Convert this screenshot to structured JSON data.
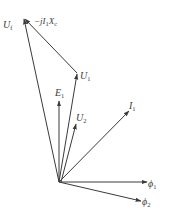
{
  "diagram": {
    "type": "phasor-diagram",
    "origin": {
      "x": 59,
      "y": 182
    },
    "stroke_color": "#3a3a3a",
    "background": "#ffffff",
    "vectors": [
      {
        "id": "Uf",
        "label": "U",
        "sub": "f",
        "from": [
          59,
          182
        ],
        "to": [
          24,
          18
        ],
        "label_pos": [
          3,
          27
        ]
      },
      {
        "id": "jIXc",
        "label": "−jI",
        "sub": "1",
        "label2": "X",
        "sub2": "c",
        "from": [
          77,
          73
        ],
        "to": [
          24,
          18
        ],
        "label_pos": [
          33,
          23
        ]
      },
      {
        "id": "U1",
        "label": "U",
        "sub": "1",
        "from": [
          59,
          182
        ],
        "to": [
          77,
          73
        ],
        "label_pos": [
          81,
          80
        ]
      },
      {
        "id": "E1",
        "label": "E",
        "sub": "1",
        "from": [
          59,
          182
        ],
        "to": [
          59,
          101
        ],
        "label_pos": [
          55,
          95
        ]
      },
      {
        "id": "U2",
        "label": "U",
        "sub": "2",
        "from": [
          59,
          182
        ],
        "to": [
          76,
          124
        ],
        "label_pos": [
          76,
          120
        ]
      },
      {
        "id": "I1",
        "label": "I",
        "sub": "1",
        "from": [
          59,
          182
        ],
        "to": [
          129,
          111
        ],
        "label_pos": [
          129,
          111
        ]
      },
      {
        "id": "Phi1",
        "label": "ϕ",
        "sub": "1",
        "from": [
          59,
          182
        ],
        "to": [
          147,
          182
        ],
        "label_pos": [
          148,
          186
        ]
      },
      {
        "id": "Phi2",
        "label": "ϕ",
        "sub": "2",
        "from": [
          59,
          182
        ],
        "to": [
          141,
          201
        ],
        "label_pos": [
          142,
          206
        ]
      }
    ]
  },
  "labels": {
    "Uf": "U",
    "Uf_sub": "f",
    "jIXc_a": "−jI",
    "jIXc_a_sub": "1",
    "jIXc_b": "X",
    "jIXc_b_sub": "c",
    "U1": "U",
    "U1_sub": "1",
    "E1": "E",
    "E1_sub": "1",
    "U2": "U",
    "U2_sub": "2",
    "I1": "I",
    "I1_sub": "1",
    "Phi1": "ϕ",
    "Phi1_sub": "1",
    "Phi2": "ϕ",
    "Phi2_sub": "2"
  }
}
